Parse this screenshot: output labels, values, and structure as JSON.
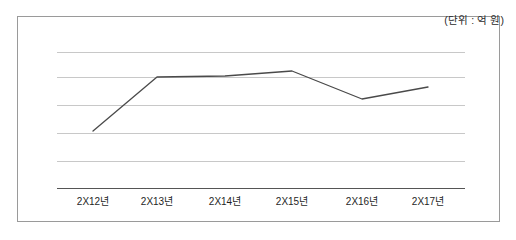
{
  "figure": {
    "unit_note": "(단위 : 억 원)",
    "border_color": "#9a9a9a",
    "background_color": "#ffffff",
    "gridline_color": "#c8c8c8",
    "axis_color": "#555555",
    "series_color": "#4a4a4a"
  },
  "chart_data": {
    "type": "line",
    "title": "",
    "subtitle": "",
    "xlabel": "",
    "ylabel": "",
    "annotations": [
      "(단위 : 억 원)"
    ],
    "legend": [],
    "legend_position": "none",
    "grid": true,
    "grid_lines_count": 5,
    "categories": [
      "2X12년",
      "2X13년",
      "2X14년",
      "2X15년",
      "2X16년",
      "2X17년"
    ],
    "x": [
      93,
      157,
      225,
      292,
      362,
      428
    ],
    "axis_pixels": {
      "plot_left": 57,
      "plot_right": 465,
      "baseline_y": 188,
      "gridline_y": [
        52,
        77,
        105,
        133,
        161
      ]
    },
    "series": [
      {
        "name": "매출액",
        "values": [
          2.05,
          3.97,
          4.04,
          4.21,
          3.18,
          3.61
        ],
        "pixel_points": [
          [
            93,
            131
          ],
          [
            157,
            77
          ],
          [
            225,
            76
          ],
          [
            292,
            71
          ],
          [
            362,
            99
          ],
          [
            428,
            87
          ]
        ]
      }
    ],
    "ylim": [
      0,
      6
    ],
    "ytick_labels": []
  },
  "x_axis": {
    "ticks": [
      {
        "label": "2X12년",
        "x": 93
      },
      {
        "label": "2X13년",
        "x": 157
      },
      {
        "label": "2X14년",
        "x": 225
      },
      {
        "label": "2X15년",
        "x": 292
      },
      {
        "label": "2X16년",
        "x": 362
      },
      {
        "label": "2X17년",
        "x": 428
      }
    ]
  }
}
